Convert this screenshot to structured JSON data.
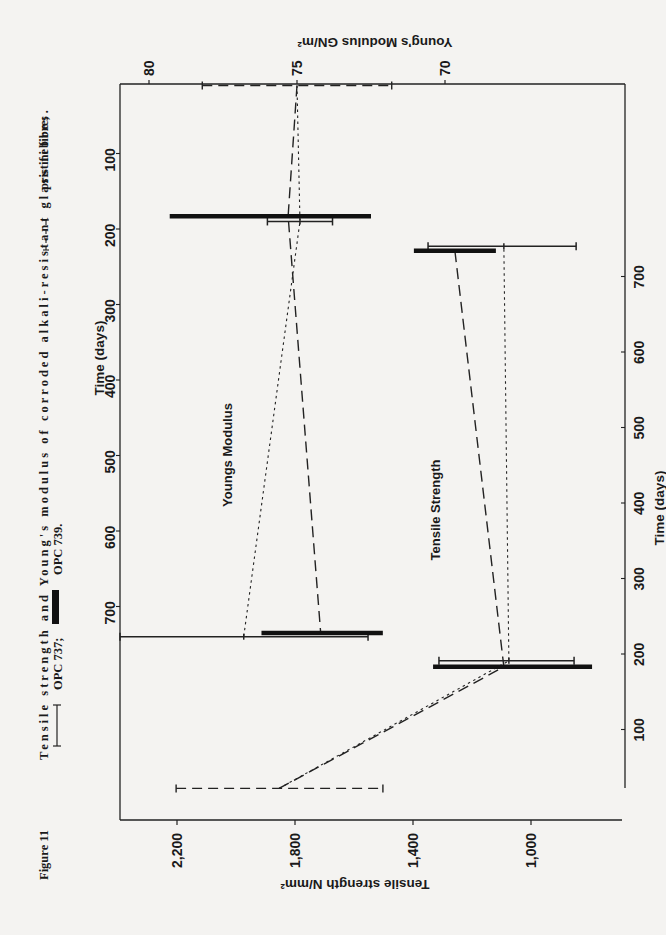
{
  "caption": {
    "figure_label": "Figure 11",
    "line1": "Tensile strength and Young's modulus of corroded alkali-resistant glass fibres.",
    "legend": [
      {
        "symbol": "thin-errorbar",
        "label": "OPC 737;"
      },
      {
        "symbol": "thick-bar",
        "label": "OPC 739."
      },
      {
        "symbol": "dashed-errorbar",
        "label": "pristine fibre;"
      }
    ]
  },
  "axes": {
    "youngs_modulus_title": "Young's Modulus GN/m²",
    "youngs_modulus_ticks": [
      "80",
      "75",
      "70"
    ],
    "tensile_strength_title": "Tensile strength N/mm²",
    "tensile_strength_ticks": [
      "2,200",
      "1,800",
      "1,400",
      "1,000"
    ],
    "time_title_upper": "Time (days)",
    "time_title_lower": "Time (days)",
    "time_ticks": [
      "100",
      "200",
      "300",
      "400",
      "500",
      "600",
      "700"
    ]
  },
  "panel_labels": {
    "youngs": "Youngs Modulus",
    "tensile": "Tensile Strength"
  },
  "chart_data": [
    {
      "type": "scatter",
      "title": "Youngs Modulus",
      "xlabel": "Time (days)",
      "ylabel": "Young's Modulus GN/m²",
      "xlim": [
        0,
        850
      ],
      "ylim": [
        66,
        82
      ],
      "yticks": [
        80,
        75,
        70
      ],
      "xticks": [
        100,
        200,
        300,
        400,
        500,
        600,
        700
      ],
      "series": [
        {
          "name": "pristine fibre",
          "style": "dashed-errorbar",
          "points": [
            {
              "day": 10,
              "mean": 75.0,
              "low": 71.8,
              "high": 78.2
            }
          ]
        },
        {
          "name": "OPC 737",
          "style": "thin-errorbar",
          "points": [
            {
              "day": 190,
              "mean": 74.9,
              "low": 73.8,
              "high": 76.0
            },
            {
              "day": 740,
              "mean": 76.8,
              "low": 72.6,
              "high": 81.0
            }
          ]
        },
        {
          "name": "OPC 739",
          "style": "thick-bar",
          "points": [
            {
              "day": 183,
              "mean": 75.3,
              "low": 72.5,
              "high": 79.3
            },
            {
              "day": 735,
              "mean": 74.2,
              "low": 72.1,
              "high": 76.2
            }
          ]
        }
      ]
    },
    {
      "type": "scatter",
      "title": "Tensile Strength",
      "xlabel": "Time (days)",
      "ylabel": "Tensile strength N/mm²",
      "xlim": [
        0,
        800
      ],
      "ylim": [
        800,
        2300
      ],
      "yticks": [
        2200,
        1800,
        1400,
        1000
      ],
      "xticks": [
        100,
        200,
        300,
        400,
        500,
        600,
        700
      ],
      "series": [
        {
          "name": "pristine fibre",
          "style": "dashed-errorbar",
          "points": [
            {
              "day": 22,
              "mean": 1854,
              "low": 1502,
              "high": 2203
            }
          ]
        },
        {
          "name": "OPC 737",
          "style": "thin-errorbar",
          "points": [
            {
              "day": 191,
              "mean": 1075,
              "low": 854,
              "high": 1312
            },
            {
              "day": 740,
              "mean": 1092,
              "low": 847,
              "high": 1349
            }
          ]
        },
        {
          "name": "OPC 739",
          "style": "thick-bar",
          "points": [
            {
              "day": 183,
              "mean": 1092,
              "low": 793,
              "high": 1332
            },
            {
              "day": 734,
              "mean": 1258,
              "low": 1119,
              "high": 1397
            }
          ]
        }
      ]
    }
  ]
}
